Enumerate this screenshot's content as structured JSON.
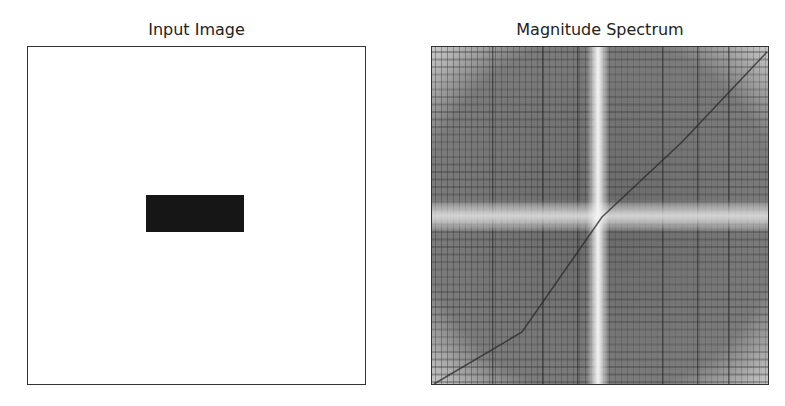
{
  "chart_data": [
    {
      "type": "heatmap",
      "title": "Input Image",
      "xlabel": "",
      "ylabel": "",
      "axes_ticks": "off",
      "colormap": "gray",
      "description": "White square image with a single black rectangle near the center-left",
      "image_size_px": [
        339,
        339
      ],
      "background_value": 255,
      "shapes": [
        {
          "shape": "rectangle",
          "value": 0,
          "x0_frac": 0.35,
          "x1_frac": 0.64,
          "y0_frac": 0.44,
          "y1_frac": 0.55
        }
      ]
    },
    {
      "type": "heatmap",
      "title": "Magnitude Spectrum",
      "xlabel": "",
      "ylabel": "",
      "axes_ticks": "off",
      "colormap": "gray",
      "description": "Log magnitude FFT spectrum (shifted): bright vertical band at center column, bright horizontal band at center row, dark diagonal streak from bottom-left to top-right, dense grid of dark vertical and horizontal lines",
      "features": {
        "vertical_band_x_frac": 0.5,
        "horizontal_band_y_frac": 0.5,
        "diagonal": "bottom-left to top-right",
        "grid_lines": true
      }
    }
  ],
  "titles": {
    "left": "Input Image",
    "right": "Magnitude Spectrum"
  }
}
